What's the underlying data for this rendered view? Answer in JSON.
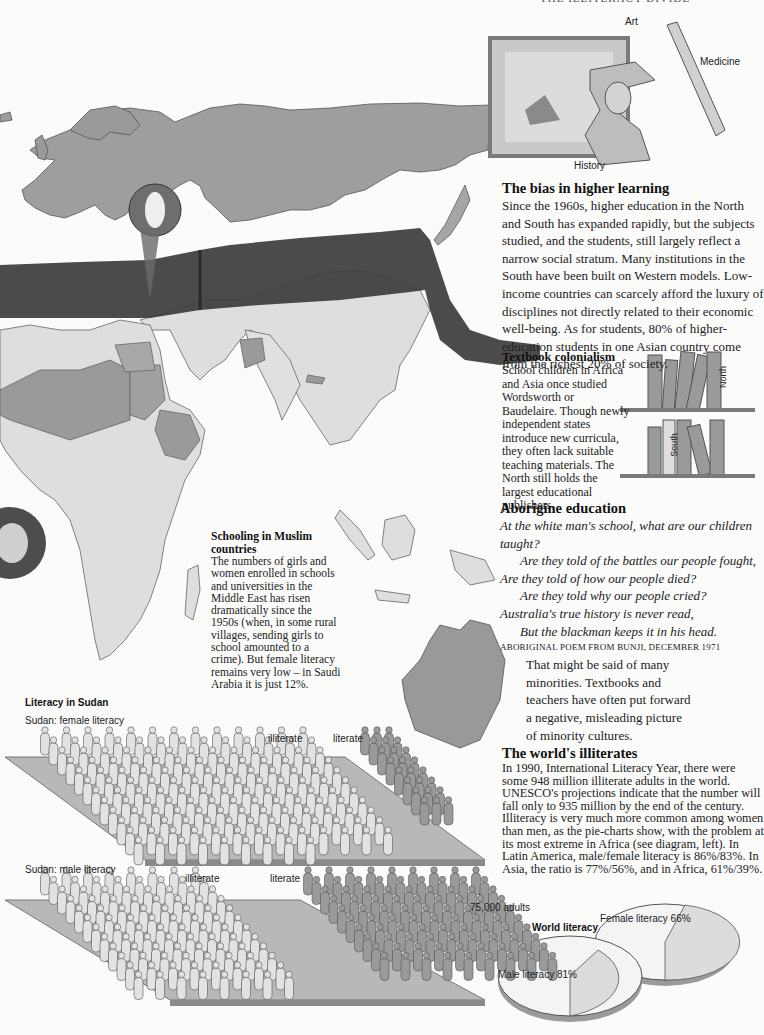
{
  "page": {
    "header_fragment": "THE ILLITERACY DIVIDE"
  },
  "illustrations": {
    "art_label": "Art",
    "medicine_label": "Medicine",
    "history_label": "History"
  },
  "higher_learning": {
    "title": "The bias in higher learning",
    "body": "Since the 1960s, higher education in the North and South has expanded rapidly, but the subjects studied, and the students, still largely reflect a narrow social stratum. Many institutions in the South have been built on Western models. Low-income countries can scarcely afford the luxury of disciplines not directly related to their economic well-being. As for students, 80% of higher-education students in one Asian country come from the richest 20% of society."
  },
  "textbook_colonialism": {
    "title": "Textbook colonialism",
    "body": "School children in Africa and Asia once studied Wordsworth or Baudelaire. Though newly independent states introduce new curricula, they often lack suitable teaching materials. The North still holds the largest educational publishers.",
    "shelf_top_label": "North",
    "shelf_bottom_label": "South"
  },
  "aborigine_education": {
    "title": "Aborigine education",
    "poem_lines": [
      "At the white man's school, what are our children taught?",
      "Are they told of the battles our people fought,",
      "Are they told of how our people died?",
      "Are they told why our people cried?",
      "Australia's true history is never read,",
      "But the blackman keeps it in his head."
    ],
    "attribution": "ABORIGINAL POEM FROM BUNJI, DECEMBER 1971",
    "body": "That might be said of many minorities. Textbooks and teachers have often put forward a negative, misleading picture of minority cultures."
  },
  "muslim_schooling": {
    "title": "Schooling in Muslim countries",
    "body": "The numbers of girls and women enrolled in schools and universities in the Middle East has risen dramatically since the 1950s (when, in some rural villages, sending girls to school amounted to a crime). But female literacy remains very low – in Saudi Arabia it is just 12%."
  },
  "worlds_illiterates": {
    "title": "The world's illiterates",
    "body": "In 1990, International Literacy Year, there were some 948 million illiterate adults in the world. UNESCO's projections indicate that the number will fall only to 935 million by the end of the century. Illiteracy is very much more common among women than men, as the pie-charts show, with the problem at its most extreme in Africa (see diagram, left). In Latin America, male/female literacy is 86%/83%. In Asia, the ratio is 77%/56%, and in Africa, 61%/39%."
  },
  "sudan_literacy": {
    "title": "Literacy in Sudan",
    "female_label": "Sudan: female literacy",
    "male_label": "Sudan: male literacy",
    "illiterate_label": "illiterate",
    "literate_label": "literate",
    "unit_label": "75,000 adults",
    "female": {
      "illiterate_figures": 152,
      "literate_figures": 24
    },
    "male": {
      "illiterate_figures": 96,
      "literate_figures": 90
    }
  },
  "world_literacy": {
    "title": "World literacy",
    "male_label": "Male literacy 81%",
    "female_label": "Female literacy 66%",
    "male_pct": 81,
    "female_pct": 66
  },
  "chart_data": [
    {
      "type": "pie",
      "title": "World literacy",
      "categories": [
        "Male literacy",
        "Male illiteracy"
      ],
      "values": [
        81,
        19
      ]
    },
    {
      "type": "pie",
      "title": "World literacy",
      "categories": [
        "Female literacy",
        "Female illiteracy"
      ],
      "values": [
        66,
        34
      ]
    },
    {
      "type": "bar",
      "title": "Literacy in Sudan (pictogram, 1 figure = 75,000 adults)",
      "categories": [
        "Female",
        "Male"
      ],
      "series": [
        {
          "name": "illiterate",
          "values": [
            152,
            96
          ]
        },
        {
          "name": "literate",
          "values": [
            24,
            90
          ]
        }
      ]
    }
  ],
  "colors": {
    "land_dark": "#8f8f8f",
    "land_mid": "#a9a9a9",
    "land_light": "#dcdcdc",
    "banner": "#3a3a3a",
    "figure_light": "#e2e2e2",
    "figure_dark": "#9a9a9a",
    "platform": "#b4b4b4"
  }
}
